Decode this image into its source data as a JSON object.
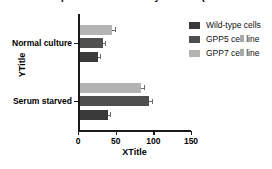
{
  "chart_data": {
    "type": "bar",
    "orientation": "horizontal",
    "title": "Comparison of confluency for cells (mock data only)",
    "xlabel": "XTitle",
    "ylabel": "YTitle",
    "categories": [
      "Normal culture",
      "Serum starved"
    ],
    "xlim": [
      0,
      150
    ],
    "xticks": [
      0,
      50,
      100,
      150
    ],
    "xticklabels": [
      "0",
      "50",
      "100",
      "150"
    ],
    "grid": false,
    "legend_position": "right",
    "series": [
      {
        "name": "Wild-type cells",
        "color": "#3a3a3a",
        "values": [
          24,
          38
        ],
        "errors": [
          3,
          3
        ]
      },
      {
        "name": "GPP5 cell line",
        "color": "#4f4f4f",
        "values": [
          31,
          92
        ],
        "errors": [
          3,
          4
        ]
      },
      {
        "name": "GPP7 cell line",
        "color": "#b3b3b3",
        "values": [
          43,
          82
        ],
        "errors": [
          4,
          4
        ]
      }
    ]
  },
  "legend": {
    "items": [
      {
        "label": "Wild-type cells",
        "color": "#3a3a3a"
      },
      {
        "label": "GPP5 cell line",
        "color": "#4f4f4f"
      },
      {
        "label": "GPP7 cell line",
        "color": "#b3b3b3"
      }
    ]
  },
  "axes": {
    "x_title": "XTitle",
    "y_title": "YTitle",
    "x_tick_labels": [
      "0",
      "50",
      "100",
      "150"
    ],
    "y_tick_labels": [
      "Normal culture",
      "Serum starved"
    ]
  }
}
